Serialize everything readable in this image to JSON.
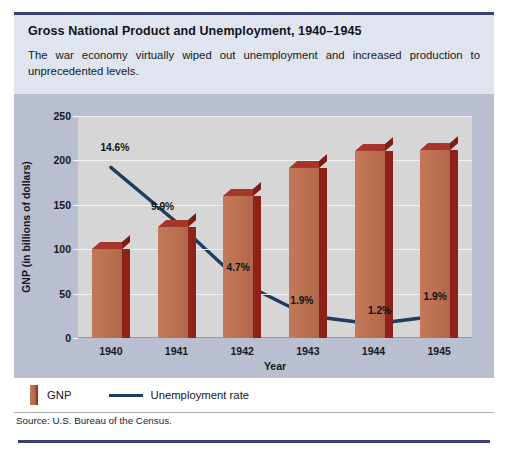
{
  "figure": {
    "title": "Gross National Product and Unemployment, 1940–1945",
    "description": "The war economy virtually wiped out unemployment and increased production to unprecedented levels.",
    "source": "Source: U.S. Bureau of the Census."
  },
  "legend": {
    "gnp_label": "GNP",
    "unemployment_label": "Unemployment rate"
  },
  "colors": {
    "bar_front": "#bb7050",
    "bar_side": "#8e2218",
    "bar_top": "#a8352a",
    "line": "#1f3d5c",
    "header_band": "#dfe4ee",
    "chart_band": "#b9bfd1",
    "plot_background": "#d6d6d6",
    "gridline": "#f2f2f2",
    "rule_navy": "#3b3f72"
  },
  "chart_data": {
    "type": "bar",
    "title": "Gross National Product and Unemployment, 1940–1945",
    "categories": [
      "1940",
      "1941",
      "1942",
      "1943",
      "1944",
      "1945"
    ],
    "xlabel": "Year",
    "ylabel": "GNP (in billions of dollars)",
    "ylim": [
      0,
      250
    ],
    "yticks": [
      0,
      50,
      100,
      150,
      200,
      250
    ],
    "grid": true,
    "legend_position": "below-plot",
    "series": [
      {
        "name": "GNP",
        "type": "bar",
        "unit": "billions of dollars",
        "values": [
          100,
          125,
          160,
          192,
          211,
          212
        ]
      },
      {
        "name": "Unemployment rate",
        "type": "line",
        "unit": "percent",
        "values": [
          14.6,
          9.9,
          4.7,
          1.9,
          1.2,
          1.9
        ],
        "labels": [
          "14.6%",
          "9.9%",
          "4.7%",
          "1.9%",
          "1.2%",
          "1.9%"
        ]
      }
    ]
  }
}
